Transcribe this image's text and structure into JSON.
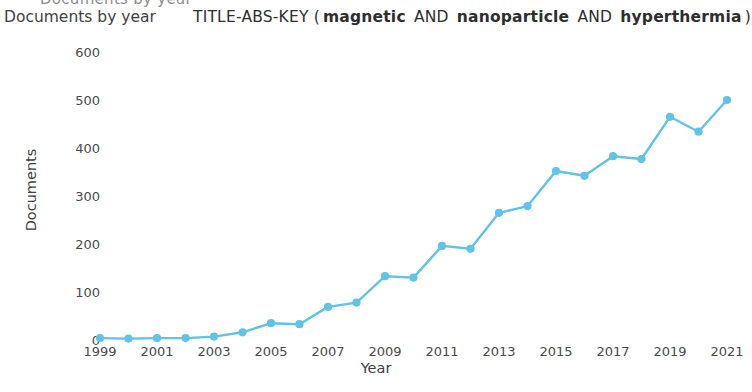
{
  "clipped_header_text": "Documents by year",
  "caption": "Documents by year",
  "query": {
    "prefix": "TITLE-ABS-KEY (",
    "terms": [
      "magnetic",
      "nanoparticle",
      "hyperthermia"
    ],
    "operator": "AND",
    "suffix": ")",
    "full_text": "TITLE-ABS-KEY ( magnetic AND nanoparticle AND hyperthermia )"
  },
  "colors": {
    "line": "#61c3e8",
    "marker": "#61c3e8",
    "text": "#3f3f3f",
    "background": "#ffffff"
  },
  "chart_data": {
    "type": "line",
    "title": "Documents by year",
    "subtitle": "TITLE-ABS-KEY ( magnetic AND nanoparticle AND hyperthermia )",
    "xlabel": "Year",
    "ylabel": "Documents",
    "xlim": [
      1999,
      2021
    ],
    "ylim": [
      0,
      600
    ],
    "ytick_labels": [
      "0",
      "100",
      "200",
      "300",
      "400",
      "500",
      "600"
    ],
    "ytick_values": [
      0,
      100,
      200,
      300,
      400,
      500,
      600
    ],
    "xtick_labels": [
      "1999",
      "2001",
      "2003",
      "2005",
      "2007",
      "2009",
      "2011",
      "2013",
      "2015",
      "2017",
      "2019",
      "2021"
    ],
    "xtick_values": [
      1999,
      2001,
      2003,
      2005,
      2007,
      2009,
      2011,
      2013,
      2015,
      2017,
      2019,
      2021
    ],
    "grid": false,
    "legend": false,
    "x": [
      1999,
      2000,
      2001,
      2002,
      2003,
      2004,
      2005,
      2006,
      2007,
      2008,
      2009,
      2010,
      2011,
      2012,
      2013,
      2014,
      2015,
      2016,
      2017,
      2018,
      2019,
      2020,
      2021
    ],
    "values": [
      4,
      3,
      4,
      4,
      7,
      16,
      35,
      33,
      69,
      78,
      133,
      130,
      196,
      190,
      265,
      279,
      352,
      342,
      383,
      377,
      465,
      434,
      500
    ],
    "series": [
      {
        "name": "Documents",
        "values": [
          4,
          3,
          4,
          4,
          7,
          16,
          35,
          33,
          69,
          78,
          133,
          130,
          196,
          190,
          265,
          279,
          352,
          342,
          383,
          377,
          465,
          434,
          500
        ]
      }
    ]
  }
}
